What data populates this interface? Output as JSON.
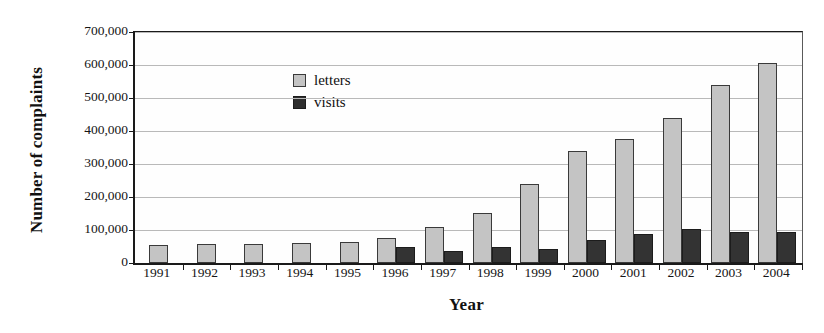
{
  "chart_data": {
    "type": "bar",
    "title": "",
    "xlabel": "Year",
    "ylabel": "Number of complaints",
    "categories": [
      "1991",
      "1992",
      "1993",
      "1994",
      "1995",
      "1996",
      "1997",
      "1998",
      "1999",
      "2000",
      "2001",
      "2002",
      "2003",
      "2004"
    ],
    "series": [
      {
        "name": "letters",
        "color": "#c4c4c4",
        "values": [
          55000,
          57000,
          58000,
          60000,
          65000,
          75000,
          110000,
          152000,
          240000,
          338000,
          375000,
          440000,
          540000,
          605000
        ]
      },
      {
        "name": "visits",
        "color": "#333333",
        "values": [
          null,
          null,
          null,
          null,
          null,
          50000,
          35000,
          48000,
          43000,
          70000,
          88000,
          103000,
          93000,
          93000
        ]
      }
    ],
    "ylim": [
      0,
      700000
    ],
    "y_ticks": [
      0,
      100000,
      200000,
      300000,
      400000,
      500000,
      600000,
      700000
    ],
    "y_tick_labels": [
      "0",
      "100,000",
      "200,000",
      "300,000",
      "400,000",
      "500,000",
      "600,000",
      "700,000"
    ],
    "grid": true,
    "legend_position": "top-left",
    "legend": [
      {
        "label": "letters",
        "swatch": "letters"
      },
      {
        "label": "visits",
        "swatch": "visits"
      }
    ]
  }
}
